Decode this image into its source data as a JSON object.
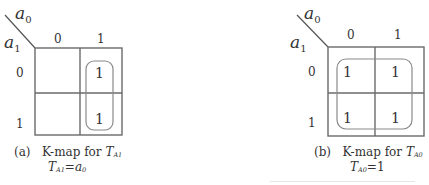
{
  "colors": {
    "grid": "#6a6a6a",
    "group_loop": "#8a8a8a",
    "text": "#333333"
  },
  "maps": [
    {
      "id": "a",
      "col_var": {
        "base": "a",
        "sub": "0"
      },
      "row_var": {
        "base": "a",
        "sub": "1"
      },
      "col_labels": [
        "0",
        "1"
      ],
      "row_labels": [
        "0",
        "1"
      ],
      "cells": [
        [
          "",
          "1"
        ],
        [
          "",
          "1"
        ]
      ],
      "groups": [
        {
          "cells": [
            [
              0,
              1
            ],
            [
              1,
              1
            ]
          ],
          "shape": "vertical-column-1"
        }
      ],
      "caption": {
        "tag": "(a)",
        "title": "K-map for",
        "fn_base": "T",
        "fn_sub": "A1",
        "eq_lhs_base": "T",
        "eq_lhs_sub": "A1",
        "eq_sign": "=",
        "eq_rhs_base": "a",
        "eq_rhs_sub": "0"
      }
    },
    {
      "id": "b",
      "col_var": {
        "base": "a",
        "sub": "0"
      },
      "row_var": {
        "base": "a",
        "sub": "1"
      },
      "col_labels": [
        "0",
        "1"
      ],
      "row_labels": [
        "0",
        "1"
      ],
      "cells": [
        [
          "1",
          "1"
        ],
        [
          "1",
          "1"
        ]
      ],
      "groups": [
        {
          "cells": [
            [
              0,
              0
            ],
            [
              0,
              1
            ],
            [
              1,
              0
            ],
            [
              1,
              1
            ]
          ],
          "shape": "all-four"
        }
      ],
      "caption": {
        "tag": "(b)",
        "title": "K-map for",
        "fn_base": "T",
        "fn_sub": "A0",
        "eq_lhs_base": "T",
        "eq_lhs_sub": "A0",
        "eq_sign": "=",
        "eq_rhs": "1"
      }
    }
  ]
}
